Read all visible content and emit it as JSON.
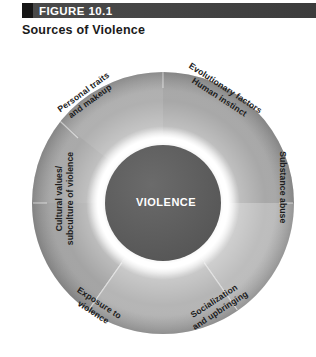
{
  "header": {
    "figure_number": "FIGURE 10.1",
    "bar_color": "#434343",
    "bar_cap_color": "#161616",
    "label_color": "#ffffff"
  },
  "title": "Sources of Violence",
  "diagram": {
    "type": "donut-segments",
    "center_label": "VIOLENCE",
    "center_fill": "#5c5c5c",
    "center_text_color": "#ffffff",
    "ring_glow_color": "#ffffff",
    "outer_radius": 131,
    "inner_radius": 58,
    "center_x": 163,
    "center_y": 203,
    "segment_count": 6,
    "segments": [
      {
        "name": "personal-traits",
        "lines": [
          "Personal traits",
          "and makeup"
        ],
        "start_angle": -90,
        "end_angle": -30,
        "fill": "#b4b4b4"
      },
      {
        "name": "evolutionary-factors",
        "lines": [
          "Evolutionary factors",
          "Human instinct"
        ],
        "start_angle": -90,
        "end_angle": -30,
        "fill": "#adadad"
      },
      {
        "name": "substance-abuse",
        "lines": [
          "Substance abuse"
        ],
        "start_angle": -30,
        "end_angle": 30,
        "fill": "#c2c2c2"
      },
      {
        "name": "socialization-upbringing",
        "lines": [
          "Socialization",
          "and upbringing"
        ],
        "start_angle": 30,
        "end_angle": 90,
        "fill": "#b9b9b9"
      },
      {
        "name": "exposure-to-violence",
        "lines": [
          "Exposure to",
          "violence"
        ],
        "start_angle": 90,
        "end_angle": 150,
        "fill": "#a9a9a9"
      },
      {
        "name": "cultural-values",
        "lines": [
          "Cultural values/",
          "subculture of violence"
        ],
        "start_angle": 150,
        "end_angle": 210,
        "fill": "#9f9f9f"
      }
    ],
    "label_text_color": "#1c1c1c"
  }
}
